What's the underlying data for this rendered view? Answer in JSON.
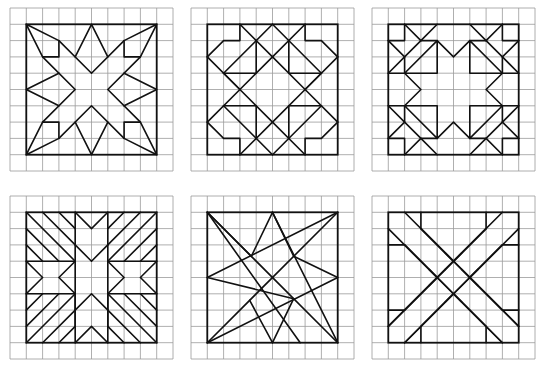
{
  "figure": {
    "grid_cells": 10,
    "cell_px": 16.3,
    "colors": {
      "grid": "#9a9a9a",
      "lines": "#111111",
      "background": "#ffffff"
    },
    "panels": [
      {
        "id": "eight-point-star",
        "origin": [
          10,
          8
        ]
      },
      {
        "id": "ohio-star-variant",
        "origin": [
          191,
          8
        ]
      },
      {
        "id": "star-ring",
        "origin": [
          372,
          8
        ]
      },
      {
        "id": "striped-cross",
        "origin": [
          10,
          196
        ]
      },
      {
        "id": "interlaced-star",
        "origin": [
          191,
          196
        ]
      },
      {
        "id": "double-x",
        "origin": [
          372,
          196
        ]
      }
    ]
  }
}
